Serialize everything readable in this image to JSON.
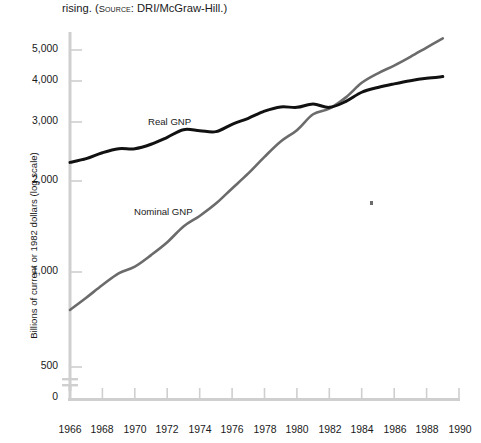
{
  "caption": {
    "lead": "rising. (",
    "source_word": "Source",
    "source_rest": ": DRI/McGraw-Hill.)",
    "full": "rising. (SOURCE: DRI/McGraw-Hill.)"
  },
  "axis": {
    "y_title": "Billions of current or 1982 dollars (log scale)",
    "y_ticks": [
      "5,000",
      "4,000",
      "3,000",
      "2,000",
      "1,000",
      "500",
      "0"
    ],
    "x_ticks": [
      "1966",
      "1968",
      "1970",
      "1972",
      "1974",
      "1976",
      "1978",
      "1980",
      "1982",
      "1984",
      "1986",
      "1988",
      "1990"
    ]
  },
  "labels": {
    "real": "Real GNP",
    "nominal": "Nominal GNP"
  },
  "colors": {
    "real_line": "#111111",
    "nominal_line": "#6b6b6b",
    "axis": "#cccccc",
    "text": "#1a1a1a"
  },
  "chart_data": {
    "type": "line",
    "title": "",
    "subtitle": "",
    "xlabel": "",
    "ylabel": "Billions of current or 1982 dollars (log scale)",
    "scale": "log",
    "grid": false,
    "legend": "inline-labels",
    "xlim": [
      1966,
      1990
    ],
    "ylim": [
      500,
      5500
    ],
    "x_tick_values": [
      1966,
      1968,
      1970,
      1972,
      1974,
      1976,
      1978,
      1980,
      1982,
      1984,
      1986,
      1988,
      1990
    ],
    "y_tick_values": [
      5000,
      4000,
      3000,
      2000,
      1000,
      500,
      0
    ],
    "axis_break": true,
    "x": [
      1966,
      1967,
      1968,
      1969,
      1970,
      1971,
      1972,
      1973,
      1974,
      1975,
      1976,
      1977,
      1978,
      1979,
      1980,
      1981,
      1982,
      1983,
      1984,
      1985,
      1986,
      1987,
      1988,
      1989
    ],
    "series": [
      {
        "name": "Real GNP",
        "color": "#111111",
        "values": [
          2210,
          2270,
          2370,
          2440,
          2440,
          2520,
          2650,
          2800,
          2780,
          2760,
          2910,
          3040,
          3200,
          3300,
          3290,
          3370,
          3290,
          3430,
          3670,
          3800,
          3900,
          3990,
          4060,
          4110
        ]
      },
      {
        "name": "Nominal GNP",
        "color": "#6b6b6b",
        "values": [
          760,
          830,
          910,
          990,
          1040,
          1130,
          1240,
          1390,
          1500,
          1640,
          1830,
          2040,
          2300,
          2570,
          2790,
          3130,
          3260,
          3530,
          3930,
          4210,
          4450,
          4740,
          5070,
          5420
        ]
      }
    ],
    "annotations": [
      {
        "text": "Real GNP",
        "x": 1971.0,
        "y": 2870
      },
      {
        "text": "Nominal GNP",
        "x": 1970.0,
        "y": 1400
      }
    ]
  }
}
